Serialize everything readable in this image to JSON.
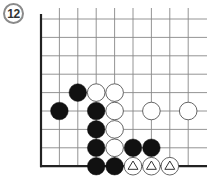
{
  "problem": {
    "number_label": "12"
  },
  "board": {
    "columns": 9,
    "rows": 9,
    "edges": [
      "left",
      "bottom"
    ],
    "line_color": "#888888",
    "edge_color": "#222222"
  },
  "stones": [
    {
      "color": "black",
      "col": 2,
      "row": 4,
      "mark": ""
    },
    {
      "color": "white",
      "col": 3,
      "row": 4,
      "mark": ""
    },
    {
      "color": "white",
      "col": 4,
      "row": 4,
      "mark": ""
    },
    {
      "color": "black",
      "col": 1,
      "row": 5,
      "mark": ""
    },
    {
      "color": "black",
      "col": 3,
      "row": 5,
      "mark": ""
    },
    {
      "color": "white",
      "col": 4,
      "row": 5,
      "mark": ""
    },
    {
      "color": "white",
      "col": 6,
      "row": 5,
      "mark": ""
    },
    {
      "color": "white",
      "col": 8,
      "row": 5,
      "mark": ""
    },
    {
      "color": "black",
      "col": 3,
      "row": 6,
      "mark": ""
    },
    {
      "color": "white",
      "col": 4,
      "row": 6,
      "mark": ""
    },
    {
      "color": "black",
      "col": 3,
      "row": 7,
      "mark": ""
    },
    {
      "color": "white",
      "col": 4,
      "row": 7,
      "mark": ""
    },
    {
      "color": "black",
      "col": 5,
      "row": 7,
      "mark": ""
    },
    {
      "color": "black",
      "col": 6,
      "row": 7,
      "mark": ""
    },
    {
      "color": "black",
      "col": 3,
      "row": 8,
      "mark": ""
    },
    {
      "color": "black",
      "col": 4,
      "row": 8,
      "mark": ""
    },
    {
      "color": "white",
      "col": 5,
      "row": 8,
      "mark": "triangle"
    },
    {
      "color": "white",
      "col": 6,
      "row": 8,
      "mark": "triangle"
    },
    {
      "color": "white",
      "col": 7,
      "row": 8,
      "mark": "triangle"
    }
  ]
}
